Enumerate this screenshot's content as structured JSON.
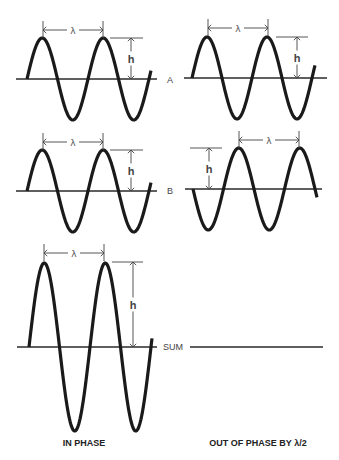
{
  "figure": {
    "labels": {
      "row_a": "A",
      "row_b": "B",
      "row_sum": "SUM",
      "wavelength_symbol": "λ",
      "height_symbol": "h",
      "caption_left": "IN PHASE",
      "caption_right": "OUT OF PHASE BY λ/2"
    },
    "colors": {
      "wave": "#1a1a1a",
      "axis": "#2a2a2a",
      "dimension": "#444444",
      "background": "#ffffff"
    }
  },
  "chart_data": {
    "type": "diagram",
    "panels": [
      {
        "id": "left-A",
        "column": "IN PHASE",
        "row": "A",
        "axis": {
          "y": 79,
          "x1": 16,
          "x2": 157
        },
        "wave": {
          "x_start": 27,
          "x_end": 151,
          "period": 61,
          "amplitude": 41,
          "start_direction": "up"
        },
        "lambda_marker": {
          "x1": 43,
          "x2": 103,
          "y": 30
        },
        "h_marker": {
          "x": 131,
          "y_top": 38,
          "y_bottom": 79,
          "line_x1": 110,
          "line_x2": 143
        }
      },
      {
        "id": "right-A",
        "column": "OUT OF PHASE BY λ/2",
        "row": "A",
        "axis": {
          "y": 78,
          "x1": 184,
          "x2": 327
        },
        "wave": {
          "x_start": 192,
          "x_end": 315,
          "period": 60,
          "amplitude": 41,
          "start_direction": "up"
        },
        "lambda_marker": {
          "x1": 208,
          "x2": 268,
          "y": 28
        },
        "h_marker": {
          "x": 297,
          "y_top": 37,
          "y_bottom": 78,
          "line_x1": 276,
          "line_x2": 308
        }
      },
      {
        "id": "left-B",
        "column": "IN PHASE",
        "row": "B",
        "axis": {
          "y": 191,
          "x1": 16,
          "x2": 157
        },
        "wave": {
          "x_start": 27,
          "x_end": 151,
          "period": 61,
          "amplitude": 41,
          "start_direction": "up"
        },
        "lambda_marker": {
          "x1": 43,
          "x2": 103,
          "y": 142
        },
        "h_marker": {
          "x": 131,
          "y_top": 150,
          "y_bottom": 191,
          "line_x1": 110,
          "line_x2": 143
        }
      },
      {
        "id": "right-B",
        "column": "OUT OF PHASE BY λ/2",
        "row": "B",
        "axis": {
          "y": 189,
          "x1": 185,
          "x2": 322
        },
        "wave": {
          "x_start": 193,
          "x_end": 317,
          "period": 61,
          "amplitude": 41,
          "start_direction": "down"
        },
        "lambda_marker": {
          "x1": 239,
          "x2": 299,
          "y": 140
        },
        "h_marker": {
          "x": 209,
          "y_top": 148,
          "y_bottom": 189,
          "line_x1": 190,
          "line_x2": 222
        }
      },
      {
        "id": "left-SUM",
        "column": "IN PHASE",
        "row": "SUM",
        "axis": {
          "y": 347,
          "x1": 17,
          "x2": 157
        },
        "wave": {
          "x_start": 29,
          "x_end": 152,
          "period": 61,
          "amplitude": 84,
          "start_direction": "up"
        },
        "lambda_marker": {
          "x1": 44,
          "x2": 104,
          "y": 253
        },
        "h_marker": {
          "x": 133,
          "y_top": 262,
          "y_bottom": 347,
          "line_x1": 112,
          "line_x2": 143
        }
      },
      {
        "id": "right-SUM",
        "column": "OUT OF PHASE BY λ/2",
        "row": "SUM",
        "axis": {
          "y": 347,
          "x1": 190,
          "x2": 323
        },
        "wave": null,
        "note": "waves cancel — flat line"
      }
    ],
    "row_labels": [
      {
        "text": "A",
        "x": 170,
        "y": 80
      },
      {
        "text": "B",
        "x": 170,
        "y": 191
      },
      {
        "text": "SUM",
        "x": 163,
        "y": 347
      }
    ],
    "captions": [
      {
        "text": "IN PHASE",
        "x": 84,
        "y": 446
      },
      {
        "text": "OUT OF PHASE BY λ/2",
        "x": 258,
        "y": 446
      }
    ]
  }
}
